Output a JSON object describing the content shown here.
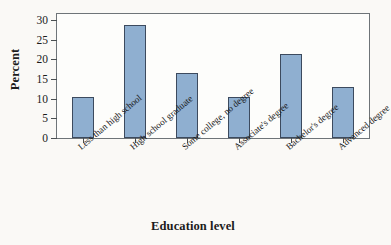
{
  "chart_data": {
    "type": "bar",
    "title": "",
    "xlabel": "Education level",
    "ylabel": "Percent",
    "categories": [
      "Less than high school",
      "High school graduate",
      "Some college, no degree",
      "Associate's degree",
      "Bachelor's degree",
      "Advanced degree"
    ],
    "values": [
      10.5,
      28.7,
      16.4,
      10.3,
      21.3,
      12.9
    ],
    "ylim": [
      0,
      31.5
    ],
    "yticks": [
      0,
      5,
      10,
      15,
      20,
      25,
      30
    ],
    "ytick_labels": [
      "0",
      "5",
      "10",
      "15",
      "20",
      "25",
      "30"
    ],
    "grid": false,
    "legend": false,
    "bar_color": "#8fafd0",
    "bar_edge_color": "#3c4a5e",
    "frame_color": "#6e7478",
    "background_color": "#faf9f6",
    "plot_background_color": "#fdfdfb"
  }
}
